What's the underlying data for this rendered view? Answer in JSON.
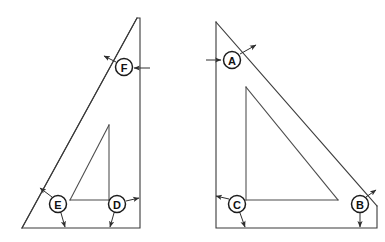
{
  "drawing": {
    "title": "Triangular gusset cross-section callout drawing",
    "background_color": "#ffffff",
    "line_color": "#3a3a3a",
    "balloon_fill": "#ffffff",
    "balloon_stroke": "#1c1c1c",
    "balloon_text_color": "#111111",
    "canvas": {
      "width": 385,
      "height": 242
    },
    "figures": [
      {
        "id": "left-figure",
        "name": "left-triangle-assembly",
        "outer_outline_points": "137,18 140,18 140,228 22,228",
        "outer_hypotenuse": "137,18 22,228",
        "inner_outline_points": "109,125 109,200 70,200",
        "inner_hypotenuse": "109,125 70,200",
        "balloons": [
          "F",
          "E",
          "D"
        ]
      },
      {
        "id": "right-figure",
        "name": "right-triangle-assembly",
        "outer_outline_points": "216,22 216,228 377,228 377,206",
        "outer_hypotenuse": "216,22 377,206",
        "inner_outline_points": "246,87 246,200 338,200",
        "inner_hypotenuse": "246,87 338,200",
        "balloons": [
          "A",
          "C",
          "B"
        ]
      }
    ],
    "balloons": [
      {
        "id": "balloon-f",
        "label": "F",
        "cx": 124,
        "cy": 67,
        "r": 8.5,
        "leaders": [
          {
            "name": "leader-f-left",
            "path": "M 116,62 L 104,56",
            "arrow_at": "end",
            "arrow_angle": 207
          },
          {
            "name": "leader-f-right",
            "path": "M 133,68 L 150,68",
            "arrow_at": "start",
            "arrow_angle": 0
          }
        ]
      },
      {
        "id": "balloon-e",
        "label": "E",
        "cx": 58,
        "cy": 204,
        "r": 8.5,
        "leaders": [
          {
            "name": "leader-e-upleft",
            "path": "M 52,197 L 40,188",
            "arrow_at": "end",
            "arrow_angle": 217
          },
          {
            "name": "leader-e-down",
            "path": "M 61,213 L 65,228",
            "arrow_at": "end",
            "arrow_angle": 75
          }
        ]
      },
      {
        "id": "balloon-d",
        "label": "D",
        "cx": 117,
        "cy": 204,
        "r": 8.5,
        "leaders": [
          {
            "name": "leader-d-upright",
            "path": "M 126,201 L 140,198",
            "arrow_at": "end",
            "arrow_angle": 348
          },
          {
            "name": "leader-d-down",
            "path": "M 114,213 L 110,228",
            "arrow_at": "end",
            "arrow_angle": 105
          }
        ]
      },
      {
        "id": "balloon-a",
        "label": "A",
        "cx": 232,
        "cy": 60,
        "r": 8.5,
        "leaders": [
          {
            "name": "leader-a-left",
            "path": "M 223,60 L 206,60",
            "arrow_at": "start",
            "arrow_angle": 180
          },
          {
            "name": "leader-a-upright",
            "path": "M 240,54 L 256,45",
            "arrow_at": "end",
            "arrow_angle": 330
          }
        ]
      },
      {
        "id": "balloon-c",
        "label": "C",
        "cx": 237,
        "cy": 204,
        "r": 8.5,
        "leaders": [
          {
            "name": "leader-c-upleft",
            "path": "M 229,199 L 215,196",
            "arrow_at": "end",
            "arrow_angle": 192
          },
          {
            "name": "leader-c-down",
            "path": "M 240,213 L 245,228",
            "arrow_at": "end",
            "arrow_angle": 72
          }
        ]
      },
      {
        "id": "balloon-b",
        "label": "B",
        "cx": 360,
        "cy": 204,
        "r": 8.5,
        "leaders": [
          {
            "name": "leader-b-upright",
            "path": "M 366,197 L 377,189",
            "arrow_at": "end",
            "arrow_angle": 324
          },
          {
            "name": "leader-b-down",
            "path": "M 360,213 L 360,228",
            "arrow_at": "end",
            "arrow_angle": 90
          }
        ]
      }
    ]
  }
}
